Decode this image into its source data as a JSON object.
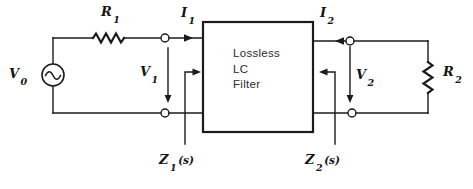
{
  "labels": {
    "v0": {
      "base": "V",
      "sub": "0"
    },
    "r1": {
      "base": "R",
      "sub": "1"
    },
    "i1": {
      "base": "I",
      "sub": "1"
    },
    "v1": {
      "base": "V",
      "sub": "1"
    },
    "i2": {
      "base": "I",
      "sub": "2"
    },
    "v2": {
      "base": "V",
      "sub": "2"
    },
    "r2": {
      "base": "R",
      "sub": "2"
    },
    "z1": {
      "base": "Z",
      "sub": "1",
      "suffix": "(s)"
    },
    "z2": {
      "base": "Z",
      "sub": "2",
      "suffix": "(s)"
    }
  },
  "filter_box": {
    "line1": "Lossless",
    "line2": "LC",
    "line3": "Filter"
  },
  "colors": {
    "ink": "#1b1b1b",
    "background": "#ffffff"
  }
}
